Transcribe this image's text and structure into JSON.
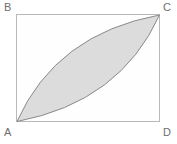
{
  "figure": {
    "type": "geometry-diagram",
    "background_color": "#ffffff",
    "rectangle": {
      "name": "rectangle-ABCD",
      "x": 16,
      "y": 14,
      "width": 144,
      "height": 108,
      "fill": "#fefefe",
      "stroke": "#b9b9b9",
      "stroke_width": 1
    },
    "vertices": [
      {
        "id": "B",
        "label": "B",
        "corner": "top-left",
        "x": 16,
        "y": 14
      },
      {
        "id": "C",
        "label": "C",
        "corner": "top-right",
        "x": 160,
        "y": 14
      },
      {
        "id": "A",
        "label": "A",
        "corner": "bottom-left",
        "x": 16,
        "y": 122
      },
      {
        "id": "D",
        "label": "D",
        "corner": "bottom-right",
        "x": 160,
        "y": 122
      }
    ],
    "lens": {
      "name": "shaded-lens-AC",
      "from": "A",
      "to": "C",
      "fill": "#dcdcdc",
      "stroke": "#8a8a8a",
      "stroke_width": 1,
      "arc_upper_control": {
        "x": 56,
        "y": 34
      },
      "arc_lower_control": {
        "x": 120,
        "y": 102
      }
    },
    "label_color": "#6e6e6e",
    "label_font_size": 11
  }
}
